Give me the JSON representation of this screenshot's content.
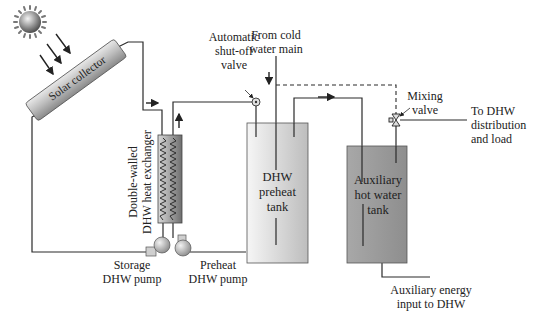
{
  "diagram": {
    "components": {
      "sun": {
        "icon": "sun-icon"
      },
      "solar_collector": {
        "label": "Solar collector"
      },
      "heat_exchanger": {
        "label_line1": "Double-walled",
        "label_line2": "DHW heat exchanger"
      },
      "storage_pump": {
        "label_line1": "Storage",
        "label_line2": "DHW pump"
      },
      "preheat_pump": {
        "label_line1": "Preheat",
        "label_line2": "DHW pump"
      },
      "shutoff_valve": {
        "label_line1": "Automatic",
        "label_line2": "shut-off",
        "label_line3": "valve"
      },
      "cold_water": {
        "label_line1": "From cold",
        "label_line2": "water main"
      },
      "preheat_tank": {
        "label_line1": "DHW",
        "label_line2": "preheat",
        "label_line3": "tank"
      },
      "aux_tank": {
        "label_line1": "Auxiliary",
        "label_line2": "hot water",
        "label_line3": "tank"
      },
      "mixing_valve": {
        "label_line1": "Mixing",
        "label_line2": "valve"
      },
      "distribution": {
        "label_line1": "To DHW",
        "label_line2": "distribution",
        "label_line3": "and load"
      },
      "aux_energy": {
        "label_line1": "Auxiliary energy",
        "label_line2": "input to DHW"
      }
    },
    "colors": {
      "line": "#2a2a2a",
      "preheat_tank_fill_light": "#f2f2f2",
      "preheat_tank_fill_dark": "#bdbdbd",
      "aux_tank_fill": "#9a9a9a",
      "collector_fill": "#c8c8c8"
    }
  }
}
